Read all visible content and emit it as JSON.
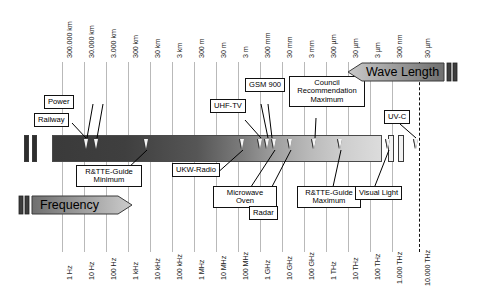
{
  "diagram": {
    "axes": {
      "wavelength": {
        "banner_label": "Wave Length",
        "direction": "left",
        "labels": [
          "300.000 km",
          "30.000 km",
          "3.000 km",
          "300 km",
          "30 km",
          "3 km",
          "300 m",
          "30 m",
          "3 m",
          "300 mm",
          "30 mm",
          "3 mm",
          "300 µm",
          "30 µm",
          "3 µm",
          "300 nm",
          "30 µm"
        ]
      },
      "frequency": {
        "banner_label": "Frequency",
        "direction": "right",
        "labels": [
          "1 Hz",
          "10 Hz",
          "100 Hz",
          "1 kHz",
          "10 kHz",
          "100 kHz",
          "1 MHz",
          "10 MHz",
          "100 MHz",
          "1 GHz",
          "10 GHz",
          "100 GHz",
          "1 THz",
          "10 THz",
          "100 THz",
          "1.000 THz",
          "10.000 THz"
        ]
      }
    },
    "callouts": [
      {
        "id": "power",
        "label": "Power",
        "position": "above"
      },
      {
        "id": "railway",
        "label": "Railway",
        "position": "above"
      },
      {
        "id": "rtte-minimum",
        "label": "R&TTE-Guide Minimum",
        "position": "below"
      },
      {
        "id": "ukw-radio",
        "label": "UKW-Radio",
        "position": "below"
      },
      {
        "id": "uhf-tv",
        "label": "UHF-TV",
        "position": "above"
      },
      {
        "id": "gsm-900",
        "label": "GSM 900",
        "position": "above"
      },
      {
        "id": "microwave-oven",
        "label": "Microwave Oven",
        "position": "below"
      },
      {
        "id": "radar",
        "label": "Radar",
        "position": "below"
      },
      {
        "id": "council-recommendation",
        "label": "Council Recommendation Maximum",
        "position": "above"
      },
      {
        "id": "rtte-maximum",
        "label": "R&TTE-Guide Maximum",
        "position": "below"
      },
      {
        "id": "visual-light",
        "label": "Visual Light",
        "position": "below"
      },
      {
        "id": "uv-c",
        "label": "UV-C",
        "position": "above"
      }
    ],
    "colors": {
      "bar_dark": "#3a3a3a",
      "bar_light": "#dcdcdc",
      "grid": "#b9b9b9",
      "outline": "#111111",
      "banner_fill": "#9a9a9a"
    }
  }
}
